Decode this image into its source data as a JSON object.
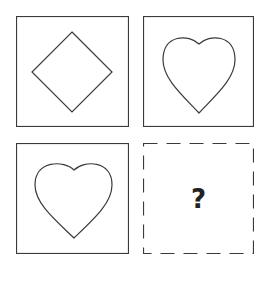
{
  "puzzle": {
    "cells": [
      {
        "position": "top-left",
        "shape": "diamond",
        "border": "solid"
      },
      {
        "position": "top-right",
        "shape": "heart",
        "border": "solid"
      },
      {
        "position": "bottom-left",
        "shape": "heart",
        "border": "solid"
      },
      {
        "position": "bottom-right",
        "shape": "unknown",
        "border": "dashed",
        "label": "?"
      }
    ],
    "colors": {
      "stroke": "#333333",
      "background": "#ffffff"
    }
  }
}
